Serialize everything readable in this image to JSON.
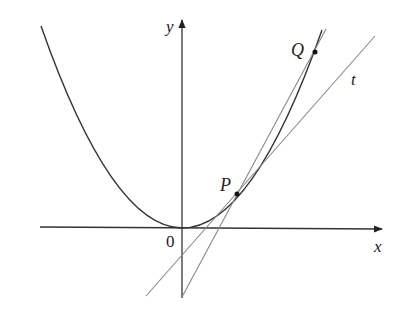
{
  "diagram": {
    "colors": {
      "curve": "#333333",
      "axis": "#333333",
      "line": "#888888",
      "point": "#111111",
      "label": "#222222"
    },
    "axes": {
      "x_label": "x",
      "y_label": "y",
      "origin_label": "0"
    },
    "curve": {
      "type": "parabola",
      "equation": "y = x^2",
      "name": "curve"
    },
    "points": [
      {
        "id": "P",
        "label": "P"
      },
      {
        "id": "Q",
        "label": "Q"
      }
    ],
    "lines": [
      {
        "id": "t",
        "label": "t",
        "kind": "tangent at P"
      },
      {
        "id": "PQ",
        "label": "",
        "kind": "secant through P and Q"
      }
    ]
  }
}
